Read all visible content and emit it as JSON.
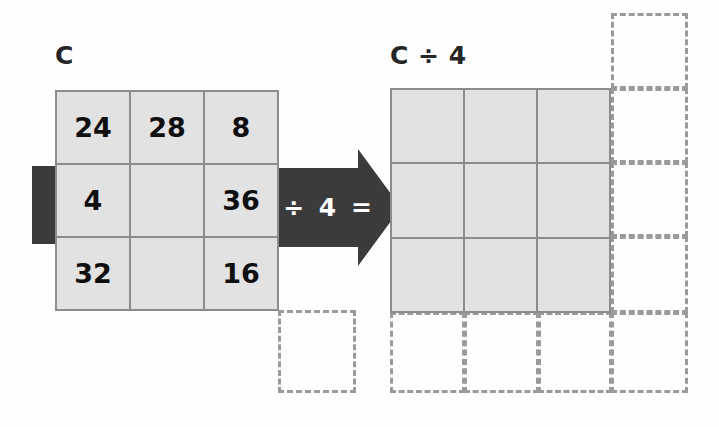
{
  "figure": {
    "kind": "matrix-scalar-division-diagram",
    "background_color": "#ffffff"
  },
  "left_matrix": {
    "label": "C",
    "rows": 3,
    "cols": 3,
    "cells": [
      [
        "24",
        "28",
        "8"
      ],
      [
        "4",
        "",
        "36"
      ],
      [
        "32",
        "",
        "16"
      ]
    ],
    "fill_color": "#e2e2e2",
    "border_color": "#8c8c8c"
  },
  "operator": {
    "text": "÷ 4 =",
    "scalar": "4",
    "symbol": "÷",
    "equals": "=",
    "color": "#3b3b3b"
  },
  "highlight_bar": {
    "color": "#3b3b3b",
    "highlighted_row_index": 1
  },
  "right_matrix": {
    "label": "C ÷ 4",
    "rows": 3,
    "cols": 3,
    "cells": [
      [
        "",
        "",
        ""
      ],
      [
        "",
        "",
        ""
      ],
      [
        "",
        "",
        ""
      ]
    ],
    "fill_color": "#e2e2e2",
    "border_color": "#8c8c8c"
  },
  "dashed_placeholders": {
    "color": "#9a9a9a",
    "style": "dashed",
    "count": 9,
    "description": "empty dashed outline cells extending the grids to the right and below"
  }
}
